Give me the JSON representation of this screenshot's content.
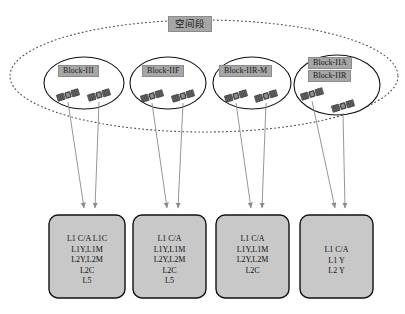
{
  "diagram": {
    "title_label": "空间段",
    "outer_boundary": "dotted-ellipse",
    "blocks": [
      {
        "id": "block-iii",
        "labels": [
          "Block-III"
        ],
        "satellites": 2
      },
      {
        "id": "block-iif",
        "labels": [
          "Block-IIF"
        ],
        "satellites": 2
      },
      {
        "id": "block-iir-m",
        "labels": [
          "Block-IIR-M"
        ],
        "satellites": 2
      },
      {
        "id": "block-iia-iir",
        "labels": [
          "Block-IIA",
          "Block-IIR"
        ],
        "satellites": 2
      }
    ],
    "signal_boxes": [
      {
        "id": "signals-block-iii",
        "lines": [
          "L1 C/A L1C",
          "L1Y,L1M",
          "L2Y,L2M",
          "L2C",
          "L5"
        ]
      },
      {
        "id": "signals-block-iif",
        "lines": [
          "L1 C/A",
          "L1Y,L1M",
          "L2Y,L2M",
          "L2C",
          "L5"
        ]
      },
      {
        "id": "signals-block-iir-m",
        "lines": [
          "L1 C/A",
          "L1Y,L1M",
          "L2Y,L2M",
          "L2C"
        ]
      },
      {
        "id": "signals-block-iia",
        "lines": [
          "L1 C/A",
          "L1 Y",
          "L2 Y"
        ]
      }
    ],
    "colors": {
      "label_fill": "#a6a6a6",
      "box_fill": "#c8c8c8",
      "stroke": "#1a1a1a",
      "arrow": "#8a8a8a",
      "satellite_body": "#4d4d4d",
      "satellite_panel": "#ffffff"
    }
  }
}
